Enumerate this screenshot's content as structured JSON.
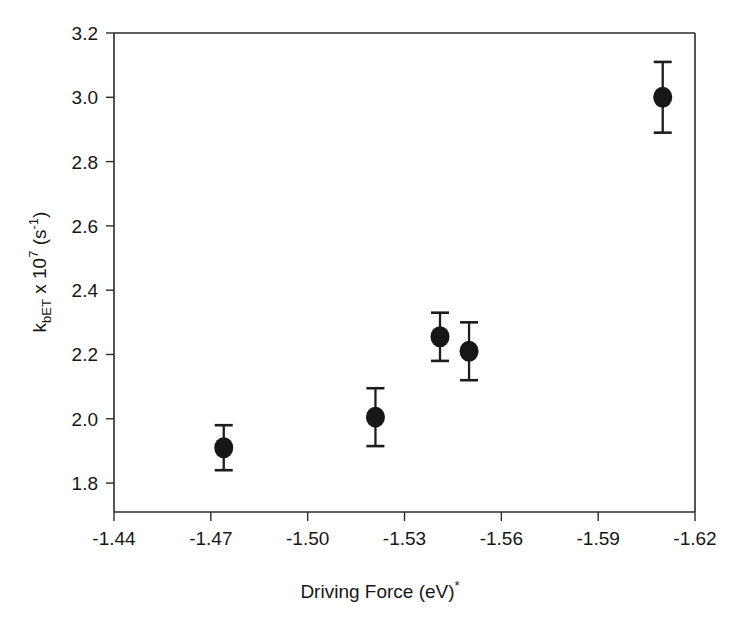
{
  "chart_data": {
    "type": "scatter",
    "title": "",
    "xlabel": "Driving Force (eV)",
    "xlabel_superscript": "*",
    "ylabel_main": "k",
    "ylabel_sub": "bET",
    "ylabel_mid": " x 10",
    "ylabel_exp": "7",
    "ylabel_tail": " (s",
    "ylabel_tail_exp": "-1",
    "ylabel_tail_end": ")",
    "ylabel_plain": "kbET x 10^7 (s^-1)",
    "xlim": [
      -1.44,
      -1.62
    ],
    "ylim": [
      1.71,
      3.2
    ],
    "x_ticks": [
      -1.44,
      -1.47,
      -1.5,
      -1.53,
      -1.56,
      -1.59,
      -1.62
    ],
    "x_tick_labels": [
      "-1.44",
      "-1.47",
      "-1.50",
      "-1.53",
      "-1.56",
      "-1.59",
      "-1.62"
    ],
    "y_ticks": [
      1.8,
      2.0,
      2.2,
      2.4,
      2.6,
      2.8,
      3.0,
      3.2
    ],
    "y_tick_labels": [
      "1.8",
      "2.0",
      "2.2",
      "2.4",
      "2.6",
      "2.8",
      "3.0",
      "3.2"
    ],
    "x_axis_reversed": true,
    "grid": false,
    "legend": null,
    "marker_style": "filled-circle",
    "marker_color": "#171717",
    "error_bar_color": "#1d1d1d",
    "axis_color": "#2b2b2b",
    "points": [
      {
        "x": -1.474,
        "y": 1.91,
        "yerr": 0.07
      },
      {
        "x": -1.521,
        "y": 2.005,
        "yerr": 0.09
      },
      {
        "x": -1.541,
        "y": 2.255,
        "yerr": 0.075
      },
      {
        "x": -1.55,
        "y": 2.21,
        "yerr": 0.09
      },
      {
        "x": -1.61,
        "y": 3.0,
        "yerr": 0.11
      }
    ]
  },
  "figure": {
    "plot_left_px": 114,
    "plot_right_px": 695,
    "plot_top_px": 33,
    "plot_bottom_px": 512
  }
}
